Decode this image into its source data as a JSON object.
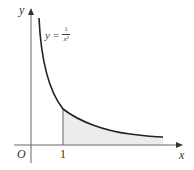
{
  "diagram": {
    "type": "function-graph",
    "function": "y = 1/x^2",
    "equation_label": {
      "lhs": "y",
      "equals": "=",
      "numerator": "1",
      "denominator": "x²"
    },
    "axes": {
      "x_label": "x",
      "y_label": "y",
      "origin_label": "O"
    },
    "ticks": [
      {
        "label": "1",
        "x_value": 1
      }
    ],
    "shaded_region": "area under curve from x = 1 to the right",
    "colors": {
      "curve": "#222222",
      "axes": "#666666",
      "shade": "#ececec"
    }
  }
}
